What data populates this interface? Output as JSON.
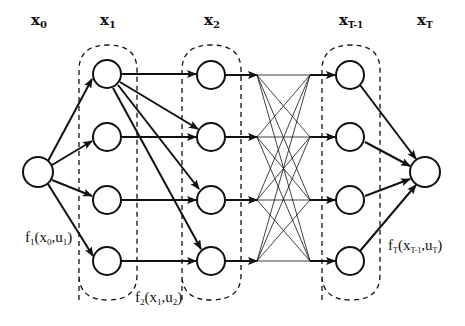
{
  "diagram": {
    "type": "dynamic-programming-stage-graph",
    "stage_labels": [
      {
        "id": "x0",
        "base": "x",
        "sub": "0"
      },
      {
        "id": "x1",
        "base": "x",
        "sub": "1"
      },
      {
        "id": "x2",
        "base": "x",
        "sub": "2"
      },
      {
        "id": "xT-1",
        "base": "x",
        "sub": "T-1"
      },
      {
        "id": "xT",
        "base": "x",
        "sub": "T"
      }
    ],
    "transition_labels": [
      {
        "id": "f1",
        "fn": "f",
        "fn_sub": "1",
        "arg1": "x",
        "arg1_sub": "0",
        "arg2": "u",
        "arg2_sub": "1"
      },
      {
        "id": "f2",
        "fn": "f",
        "fn_sub": "2",
        "arg1": "x",
        "arg1_sub": "1",
        "arg2": "u",
        "arg2_sub": "2"
      },
      {
        "id": "fT",
        "fn": "f",
        "fn_sub": "T",
        "arg1": "x",
        "arg1_sub": "T-1",
        "arg2": "u",
        "arg2_sub": "T"
      }
    ],
    "nodes_per_stage": [
      1,
      4,
      4,
      4,
      1
    ],
    "edges": {
      "x0_to_x1": "all 4",
      "x1_to_x2": "horizontal for each row, plus top node of x1 fans out to all 4 x2 nodes",
      "x2_to_xT-1": "fully connected (thin lines)",
      "xT-1_to_xT": "all 4"
    },
    "colors": {
      "stroke": "#111111",
      "background": "#ffffff"
    }
  }
}
